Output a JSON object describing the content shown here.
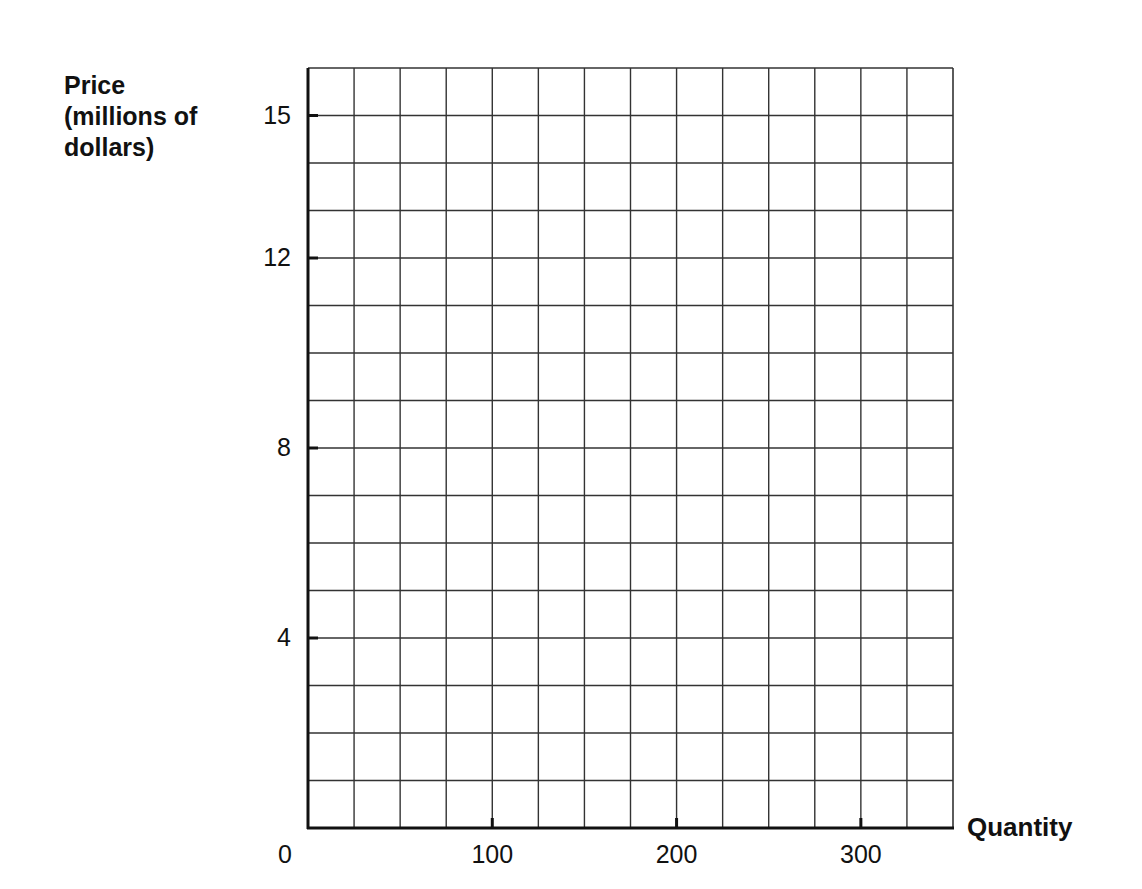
{
  "chart_data": {
    "type": "line",
    "title": "",
    "xlabel": "Quantity",
    "ylabel": "Price\n(millions of\ndollars)",
    "xlim": [
      0,
      350
    ],
    "ylim": [
      0,
      16
    ],
    "x_grid_step": 25,
    "y_grid_step": 1,
    "grid": true,
    "x_ticks": [
      {
        "value": 0,
        "label": "0"
      },
      {
        "value": 100,
        "label": "100"
      },
      {
        "value": 200,
        "label": "200"
      },
      {
        "value": 300,
        "label": "300"
      }
    ],
    "y_ticks": [
      {
        "value": 4,
        "label": "4"
      },
      {
        "value": 8,
        "label": "8"
      },
      {
        "value": 12,
        "label": "12"
      },
      {
        "value": 15,
        "label": "15"
      }
    ],
    "series": []
  },
  "colors": {
    "grid": "#333333",
    "axis": "#111111",
    "background": "#ffffff"
  }
}
